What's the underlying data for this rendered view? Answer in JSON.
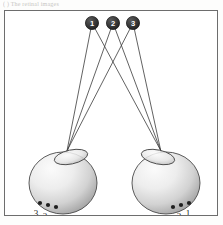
{
  "caption": {
    "text": "( ) The retinal images"
  },
  "figure": {
    "frame_color": "#6d6d6d",
    "background_color": "#ffffff",
    "ray_color": "#3a3a3a",
    "node_fill": "#2f2f2f",
    "node_text_color": "#ffffff",
    "eye_outline_color": "#4a4a4a",
    "eye_light_color": "#f2f2f2",
    "eye_dark_color": "#a9a9a9"
  },
  "object_points": [
    {
      "id": "1",
      "label": "1",
      "x": 87,
      "y": 12
    },
    {
      "id": "2",
      "label": "2",
      "x": 108,
      "y": 12
    },
    {
      "id": "3",
      "label": "3",
      "x": 128,
      "y": 12
    }
  ],
  "eyes": [
    {
      "id": "left-eye",
      "name": "left-eye",
      "center_x": 58,
      "center_y": 172,
      "radius_x": 34,
      "radius_y": 31,
      "nodal_x": 67,
      "nodal_y": 148,
      "lens_cx": 66,
      "lens_cy": 146,
      "lens_rx": 17,
      "lens_ry": 7,
      "lens_rotation": -12,
      "retina_points": [
        {
          "label": "3",
          "px": 35,
          "py": 192,
          "lx": 31,
          "ly": 202
        },
        {
          "label": "2",
          "px": 43,
          "py": 194,
          "lx": 40,
          "ly": 205
        },
        {
          "label": "1",
          "px": 51,
          "py": 196,
          "lx": 49,
          "ly": 207
        }
      ]
    },
    {
      "id": "right-eye",
      "name": "right-eye",
      "center_x": 161,
      "center_y": 172,
      "radius_x": 34,
      "radius_y": 31,
      "nodal_x": 152,
      "nodal_y": 148,
      "lens_cx": 153,
      "lens_cy": 146,
      "lens_rx": 17,
      "lens_ry": 7,
      "lens_rotation": 12,
      "retina_points": [
        {
          "label": "3",
          "px": 168,
          "py": 196,
          "lx": 165,
          "ly": 207
        },
        {
          "label": "2",
          "px": 176,
          "py": 194,
          "lx": 174,
          "ly": 205
        },
        {
          "label": "1",
          "px": 184,
          "py": 192,
          "lx": 183,
          "ly": 202
        }
      ]
    }
  ],
  "rays": [
    {
      "from": "1",
      "to": "left-eye",
      "to_point": "1"
    },
    {
      "from": "2",
      "to": "left-eye",
      "to_point": "2"
    },
    {
      "from": "3",
      "to": "left-eye",
      "to_point": "3"
    },
    {
      "from": "1",
      "to": "right-eye",
      "to_point": "1"
    },
    {
      "from": "2",
      "to": "right-eye",
      "to_point": "2"
    },
    {
      "from": "3",
      "to": "right-eye",
      "to_point": "3"
    }
  ]
}
